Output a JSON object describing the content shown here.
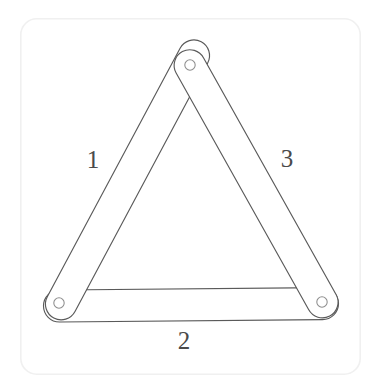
{
  "figure": {
    "background_color": "#ffffff",
    "card": {
      "border_color": "#f0f0f0",
      "fill_color": "#ffffff",
      "x": 20,
      "y": 18,
      "width": 341,
      "height": 357,
      "corner_radius": 16
    },
    "stroke_color": "#5a5a5a",
    "hole_stroke_color": "#8d8d8d",
    "label_color": "#4a4a4a"
  },
  "labels": [
    {
      "text": "1",
      "x": 93,
      "y": 161,
      "side": "left-bar"
    },
    {
      "text": "2",
      "x": 184,
      "y": 342,
      "side": "bottom-bar"
    },
    {
      "text": "3",
      "x": 287,
      "y": 160,
      "side": "right-bar"
    }
  ],
  "joints": [
    {
      "name": "apex-pivot",
      "cx": 190,
      "cy": 65,
      "r": 5.2
    },
    {
      "name": "bottom-left-pivot",
      "cx": 59,
      "cy": 303,
      "r": 5.2
    },
    {
      "name": "bottom-right-pivot",
      "cx": 322,
      "cy": 302,
      "r": 5.2
    }
  ],
  "bars": [
    {
      "name": "left-bar",
      "label": "1",
      "outline": "M 59 282 L 186 47 L 205 76 L 84 303 Z"
    },
    {
      "name": "bottom-bar",
      "label": "2",
      "outline": "M 43 291 L 338 288 L 338 319 L 43 319 Z"
    },
    {
      "name": "right-bar",
      "label": "3",
      "outline": "M 175 69 L 196 44 L 343 289 L 312 305 Z"
    }
  ]
}
